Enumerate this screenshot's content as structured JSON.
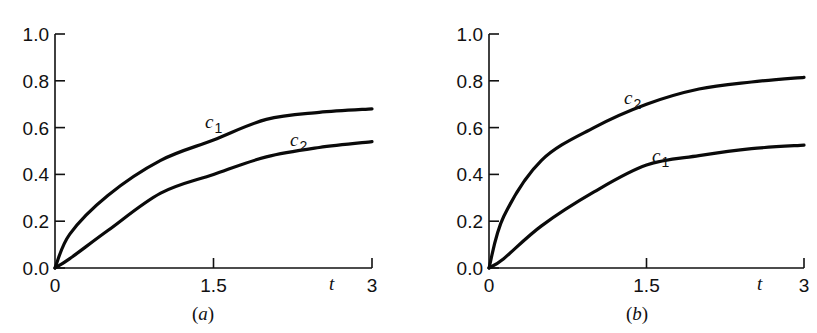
{
  "figure": {
    "panels": [
      {
        "id": "a",
        "caption_open": "(",
        "caption_letter": "a",
        "caption_close": ")"
      },
      {
        "id": "b",
        "caption_open": "(",
        "caption_letter": "b",
        "caption_close": ")"
      }
    ]
  },
  "chart_data": [
    {
      "type": "line",
      "title": "(a)",
      "xlabel": "t",
      "ylabel": "",
      "xlim": [
        0,
        3
      ],
      "ylim": [
        0,
        1.0
      ],
      "xticks": [
        "0",
        "1.5",
        "3"
      ],
      "yticks": [
        "0.0",
        "0.2",
        "0.4",
        "0.6",
        "0.8",
        "1.0"
      ],
      "grid": false,
      "legend": "inline labels",
      "x": [
        0,
        0.14,
        0.5,
        1.0,
        1.5,
        2.0,
        2.5,
        3.0
      ],
      "series": [
        {
          "name": "c1",
          "label_base": "c",
          "label_sub": "1",
          "values": [
            0,
            0.145,
            0.31,
            0.46,
            0.547,
            0.635,
            0.665,
            0.68
          ]
        },
        {
          "name": "c2",
          "label_base": "c",
          "label_sub": "2",
          "values": [
            0,
            0.04,
            0.16,
            0.32,
            0.4,
            0.475,
            0.515,
            0.54
          ]
        }
      ]
    },
    {
      "type": "line",
      "title": "(b)",
      "xlabel": "t",
      "ylabel": "",
      "xlim": [
        0,
        3
      ],
      "ylim": [
        0,
        1.0
      ],
      "xticks": [
        "0",
        "1.5",
        "3"
      ],
      "yticks": [
        "0.0",
        "0.2",
        "0.4",
        "0.6",
        "0.8",
        "1.0"
      ],
      "grid": false,
      "legend": "inline labels",
      "x": [
        0,
        0.14,
        0.5,
        1.0,
        1.5,
        2.0,
        2.5,
        3.0
      ],
      "series": [
        {
          "name": "c2",
          "label_base": "c",
          "label_sub": "2",
          "values": [
            0,
            0.22,
            0.46,
            0.6,
            0.7,
            0.765,
            0.795,
            0.815
          ]
        },
        {
          "name": "c1",
          "label_base": "c",
          "label_sub": "1",
          "values": [
            0,
            0.04,
            0.18,
            0.325,
            0.44,
            0.48,
            0.51,
            0.525
          ]
        }
      ]
    }
  ],
  "layout": {
    "panels": [
      {
        "x0": 55,
        "x1": 372,
        "y0": 268,
        "y1": 34,
        "caption_x": 203,
        "caption_y": 320,
        "t_label_x": 329,
        "t_label_y": 290,
        "series_labels": [
          {
            "x": 205,
            "y": 128
          },
          {
            "x": 290,
            "y": 146
          }
        ]
      },
      {
        "x0": 489,
        "x1": 804,
        "y0": 268,
        "y1": 34,
        "caption_x": 637,
        "caption_y": 320,
        "t_label_x": 757,
        "t_label_y": 290,
        "series_labels": [
          {
            "x": 624,
            "y": 104
          },
          {
            "x": 652,
            "y": 162
          }
        ]
      }
    ]
  }
}
